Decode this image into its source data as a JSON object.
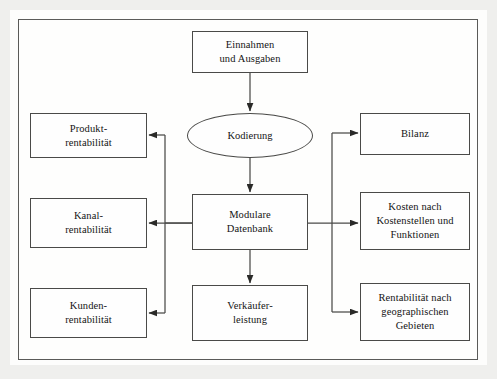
{
  "figure": {
    "language": "de"
  },
  "nodes": {
    "einnahmen": {
      "label": "Einnahmen\nund Ausgaben",
      "shape": "rectangle"
    },
    "kodierung": {
      "label": "Kodierung",
      "shape": "ellipse"
    },
    "modulare": {
      "label": "Modulare\nDatenbank",
      "shape": "rectangle"
    },
    "verkaeufer": {
      "label": "Verkäufer-\nleistung",
      "shape": "rectangle"
    },
    "produkt": {
      "label": "Produkt-\nrentabilität",
      "shape": "rectangle"
    },
    "kanal": {
      "label": "Kanal-\nrentabilität",
      "shape": "rectangle"
    },
    "kunden": {
      "label": "Kunden-\nrentabilität",
      "shape": "rectangle"
    },
    "bilanz": {
      "label": "Bilanz",
      "shape": "rectangle"
    },
    "kosten": {
      "label": "Kosten nach\nKostenstellen und\nFunktionen",
      "shape": "rectangle"
    },
    "geo": {
      "label": "Rentabilität nach\ngeographischen\nGebieten",
      "shape": "rectangle"
    }
  },
  "edges": [
    {
      "from": "einnahmen",
      "to": "kodierung",
      "direction": "down",
      "arrow": true
    },
    {
      "from": "kodierung",
      "to": "modulare",
      "direction": "down",
      "arrow": true
    },
    {
      "from": "modulare",
      "to": "verkaeufer",
      "direction": "down",
      "arrow": true
    },
    {
      "from": "modulare",
      "to": "produkt",
      "direction": "left",
      "arrow": true
    },
    {
      "from": "modulare",
      "to": "kanal",
      "direction": "left",
      "arrow": true
    },
    {
      "from": "modulare",
      "to": "kunden",
      "direction": "left",
      "arrow": true
    },
    {
      "from": "modulare",
      "to": "bilanz",
      "direction": "right",
      "arrow": true
    },
    {
      "from": "modulare",
      "to": "kosten",
      "direction": "right",
      "arrow": true
    },
    {
      "from": "modulare",
      "to": "geo",
      "direction": "right",
      "arrow": true
    }
  ],
  "colors": {
    "stroke": "#4a4a48",
    "frame": "#5a5a58",
    "text": "#141414",
    "node_fill": "#fefefe",
    "paper": "#fdfdfc",
    "page_background": "#e8e8e6"
  }
}
